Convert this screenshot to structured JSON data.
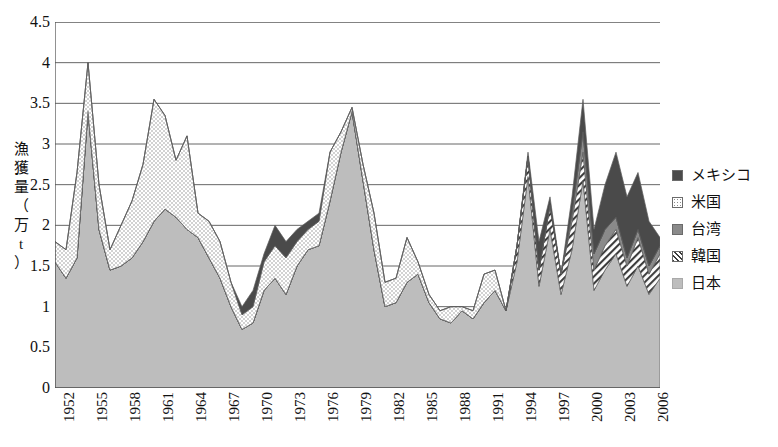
{
  "axes": {
    "y_title_chars": [
      "漁",
      "獲",
      "量",
      "（",
      "万",
      "t",
      "）"
    ],
    "y_title_text": "漁獲量（万t）",
    "y_ticks": [
      "4.5",
      "4",
      "3.5",
      "3",
      "2.5",
      "2",
      "1.5",
      "1",
      "0.5",
      "0"
    ],
    "x_ticks": [
      "1952",
      "1955",
      "1958",
      "1961",
      "1964",
      "1967",
      "1970",
      "1973",
      "1976",
      "1979",
      "1982",
      "1985",
      "1988",
      "1991",
      "1994",
      "1997",
      "2000",
      "2003",
      "2006"
    ]
  },
  "legend": {
    "items": [
      {
        "label": "メキシコ",
        "key": "mexico",
        "color": "#4a4a4a"
      },
      {
        "label": "米国",
        "key": "usa",
        "color": "#ffffff"
      },
      {
        "label": "台湾",
        "key": "taiwan",
        "color": "#8a8a8a"
      },
      {
        "label": "韓国",
        "key": "korea",
        "color": "#ffffff"
      },
      {
        "label": "日本",
        "key": "japan",
        "color": "#bdbdbd"
      }
    ]
  },
  "chart_data": {
    "type": "area",
    "stacked": true,
    "title": "",
    "xlabel": "",
    "ylabel": "漁獲量（万t）",
    "ylim": [
      0,
      4.5
    ],
    "ytick_step": 0.5,
    "grid": true,
    "legend_position": "right",
    "xtick_interval_years": 3,
    "x": [
      1952,
      1953,
      1954,
      1955,
      1956,
      1957,
      1958,
      1959,
      1960,
      1961,
      1962,
      1963,
      1964,
      1965,
      1966,
      1967,
      1968,
      1969,
      1970,
      1971,
      1972,
      1973,
      1974,
      1975,
      1976,
      1977,
      1978,
      1979,
      1980,
      1981,
      1982,
      1983,
      1984,
      1985,
      1986,
      1987,
      1988,
      1989,
      1990,
      1991,
      1992,
      1993,
      1994,
      1995,
      1996,
      1997,
      1998,
      1999,
      2000,
      2001,
      2002,
      2003,
      2004,
      2005,
      2006,
      2007
    ],
    "series": [
      {
        "name": "日本",
        "key": "japan",
        "color": "#bdbdbd",
        "pattern": "solid-light",
        "values": [
          1.55,
          1.35,
          1.6,
          3.4,
          1.95,
          1.45,
          1.5,
          1.6,
          1.8,
          2.05,
          2.2,
          2.1,
          1.95,
          1.85,
          1.6,
          1.35,
          1.0,
          0.72,
          0.8,
          1.2,
          1.35,
          1.15,
          1.5,
          1.7,
          1.75,
          2.3,
          2.9,
          3.4,
          2.55,
          1.7,
          1.0,
          1.05,
          1.3,
          1.4,
          1.05,
          0.85,
          0.8,
          0.95,
          0.85,
          1.05,
          1.2,
          0.95,
          1.55,
          2.6,
          1.25,
          1.95,
          1.15,
          1.7,
          2.55,
          1.2,
          1.45,
          1.65,
          1.25,
          1.5,
          1.15,
          1.35
        ]
      },
      {
        "name": "韓国",
        "key": "korea",
        "color": "#ffffff",
        "pattern": "hatch",
        "values": [
          0,
          0,
          0,
          0,
          0,
          0,
          0,
          0,
          0,
          0,
          0,
          0,
          0,
          0,
          0,
          0,
          0,
          0,
          0,
          0,
          0,
          0,
          0,
          0,
          0,
          0,
          0,
          0,
          0,
          0,
          0,
          0,
          0,
          0,
          0,
          0,
          0,
          0,
          0,
          0,
          0,
          0,
          0.2,
          0.25,
          0.2,
          0.3,
          0.25,
          0.35,
          0.35,
          0.25,
          0.3,
          0.3,
          0.25,
          0.35,
          0.25,
          0.3
        ]
      },
      {
        "name": "台湾",
        "key": "taiwan",
        "color": "#8a8a8a",
        "pattern": "solid-mid",
        "values": [
          0,
          0,
          0,
          0,
          0,
          0,
          0,
          0,
          0,
          0,
          0,
          0,
          0,
          0,
          0,
          0,
          0,
          0,
          0,
          0,
          0,
          0,
          0,
          0,
          0,
          0,
          0,
          0,
          0,
          0,
          0,
          0,
          0,
          0,
          0,
          0,
          0,
          0,
          0,
          0,
          0,
          0,
          0,
          0,
          0,
          0,
          0,
          0.1,
          0.25,
          0.2,
          0.2,
          0.15,
          0.1,
          0.1,
          0.1,
          0.1
        ]
      },
      {
        "name": "米国",
        "key": "usa",
        "color": "#ffffff",
        "pattern": "dots",
        "values": [
          0.25,
          0.35,
          1.05,
          0.6,
          0.55,
          0.25,
          0.5,
          0.7,
          0.95,
          1.5,
          1.15,
          0.7,
          1.15,
          0.3,
          0.45,
          0.45,
          0.3,
          0.18,
          0.2,
          0.35,
          0.4,
          0.45,
          0.3,
          0.25,
          0.3,
          0.6,
          0.25,
          0.05,
          0.2,
          0.45,
          0.3,
          0.3,
          0.55,
          0.15,
          0.1,
          0.1,
          0.2,
          0.05,
          0.1,
          0.35,
          0.25,
          0.0,
          0.0,
          0.0,
          0.0,
          0.0,
          0.0,
          0.0,
          0.0,
          0.0,
          0.0,
          0.0,
          0.0,
          0.0,
          0.0,
          0.0
        ]
      },
      {
        "name": "メキシコ",
        "key": "mexico",
        "color": "#4a4a4a",
        "pattern": "solid-dark",
        "values": [
          0,
          0,
          0,
          0,
          0,
          0,
          0,
          0,
          0,
          0,
          0,
          0,
          0,
          0,
          0,
          0,
          0,
          0.1,
          0.2,
          0.1,
          0.25,
          0.2,
          0.15,
          0.1,
          0.1,
          0,
          0,
          0,
          0,
          0,
          0,
          0,
          0,
          0,
          0,
          0,
          0,
          0,
          0,
          0,
          0,
          0,
          0,
          0.05,
          0.35,
          0.1,
          0,
          0.2,
          0.4,
          0.3,
          0.55,
          0.8,
          0.75,
          0.7,
          0.55,
          0.1
        ]
      }
    ]
  }
}
